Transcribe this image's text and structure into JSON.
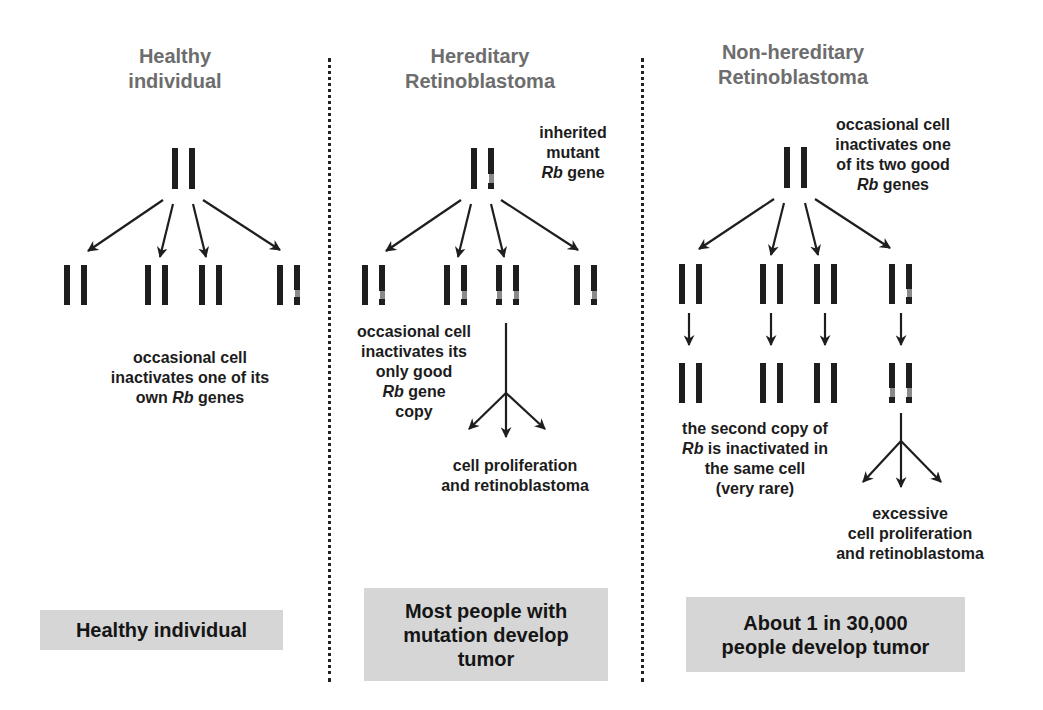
{
  "columns": [
    {
      "id": "healthy",
      "header": [
        "Healthy",
        "individual"
      ],
      "notes": {
        "main": [
          "occasional cell",
          "inactivates one of its",
          "own |Rb| genes"
        ]
      },
      "summary": [
        "Healthy individual"
      ]
    },
    {
      "id": "hereditary",
      "header": [
        "Hereditary",
        "Retinoblastoma"
      ],
      "notes": {
        "top": [
          "inherited",
          "mutant",
          "|Rb| gene"
        ],
        "main": [
          "occasional cell",
          "inactivates its",
          "only good",
          "|Rb| gene",
          "copy"
        ],
        "outcome": [
          "cell proliferation",
          "and retinoblastoma"
        ]
      },
      "summary": [
        "Most people with",
        "mutation develop",
        "tumor"
      ]
    },
    {
      "id": "nonhereditary",
      "header": [
        "Non-hereditary",
        "Retinoblastoma"
      ],
      "notes": {
        "top": [
          "occasional cell",
          "inactivates one",
          "of its two good",
          "|Rb| genes"
        ],
        "main": [
          "the second copy of",
          "|Rb| is inactivated in",
          "the same cell",
          "(very rare)"
        ],
        "outcome": [
          "excessive",
          "cell proliferation",
          "and retinoblastoma"
        ]
      },
      "summary": [
        "About 1 in 30,000",
        "people develop tumor"
      ]
    }
  ],
  "colors": {
    "header_text": "#6d6d6d",
    "body_text": "#1c1c1c",
    "chromosome": "#1e1e1e",
    "mutation_mark": "#8a8a8a",
    "summary_box": "#d6d6d6",
    "divider": "#222222"
  }
}
